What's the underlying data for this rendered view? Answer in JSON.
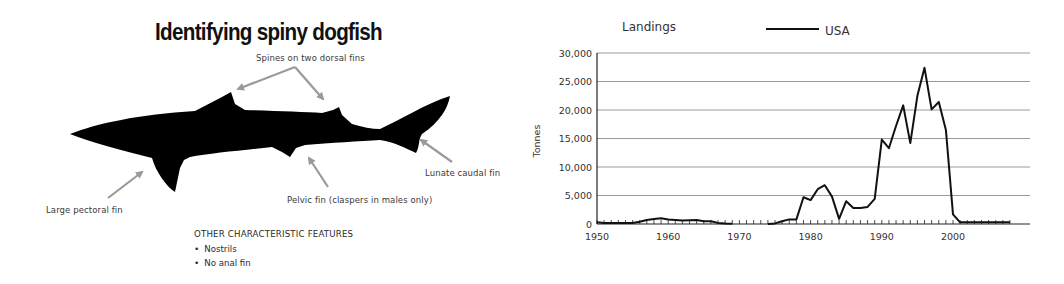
{
  "diagram": {
    "title": "Identifying spiny dogfish",
    "callouts": {
      "dorsal": "Spines on two dorsal fins",
      "pectoral": "Large pectoral fin",
      "pelvic": "Pelvic fin (claspers in males only)",
      "caudal": "Lunate caudal fin"
    },
    "features_heading": "OTHER CHARACTERISTIC FEATURES",
    "features": [
      "Nostrils",
      "No anal fin"
    ],
    "colors": {
      "silhouette": "#000000",
      "arrow": "#9a9a9a"
    }
  },
  "chart": {
    "title": "Landings",
    "legend": "USA",
    "ylabel": "Tonnes",
    "yticks": [
      "0",
      "5,000",
      "10,000",
      "15,000",
      "20,000",
      "25,000",
      "30,000"
    ],
    "xticks": [
      "1950",
      "1960",
      "1970",
      "1980",
      "1990",
      "2000"
    ]
  },
  "chart_data": {
    "type": "line",
    "title": "Landings",
    "xlabel": "",
    "ylabel": "Tonnes",
    "ylim": [
      0,
      30000
    ],
    "xlim": [
      1950,
      2008
    ],
    "grid": "horizontal",
    "legend_position": "top",
    "series": [
      {
        "name": "USA",
        "segments": [
          {
            "x": [
              1950,
              1951,
              1952,
              1953,
              1954,
              1955,
              1956,
              1957,
              1958,
              1959,
              1960,
              1961,
              1962,
              1963,
              1964,
              1965,
              1966,
              1967,
              1968,
              1969
            ],
            "y": [
              300,
              200,
              200,
              200,
              200,
              200,
              400,
              700,
              900,
              1000,
              800,
              700,
              600,
              650,
              700,
              500,
              500,
              200,
              100,
              50
            ]
          },
          {
            "x": [
              1974,
              1975,
              1976,
              1977,
              1978,
              1979,
              1980,
              1981,
              1982,
              1983,
              1984,
              1985,
              1986,
              1987,
              1988,
              1989,
              1990,
              1991,
              1992,
              1993,
              1994,
              1995,
              1996,
              1997,
              1998,
              1999,
              2000,
              2001,
              2002,
              2003,
              2004,
              2005,
              2006,
              2007,
              2008
            ],
            "y": [
              0,
              100,
              500,
              800,
              800,
              4700,
              4200,
              6100,
              6800,
              4800,
              900,
              4000,
              2800,
              2800,
              3000,
              4400,
              14800,
              13300,
              17200,
              20800,
              14200,
              22500,
              27400,
              20100,
              21400,
              16500,
              1700,
              300,
              300,
              300,
              300,
              300,
              300,
              300,
              300
            ]
          }
        ]
      }
    ]
  }
}
